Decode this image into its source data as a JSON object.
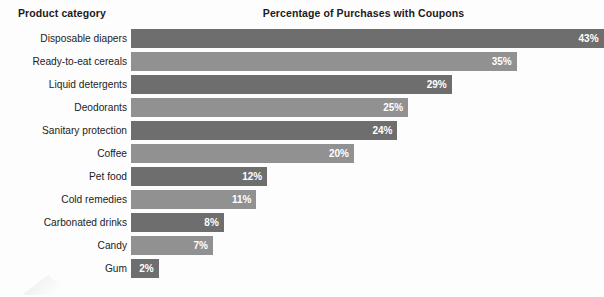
{
  "header": {
    "category_label": "Product category",
    "title": "Percentage of Purchases with Coupons"
  },
  "colors": {
    "background": "#fdfdfd",
    "bar_dark": "#6e6e6e",
    "bar_light": "#919191",
    "text": "#1c1c1c",
    "value_text": "#ffffff"
  },
  "chart_data": {
    "type": "bar",
    "orientation": "horizontal",
    "title": "Percentage of Purchases with Coupons",
    "xlabel": "",
    "ylabel": "Product category",
    "xlim": [
      0,
      43
    ],
    "grid": false,
    "legend": null,
    "value_suffix": "%",
    "categories": [
      "Disposable diapers",
      "Ready-to-eat cereals",
      "Liquid detergents",
      "Deodorants",
      "Sanitary protection",
      "Coffee",
      "Pet food",
      "Cold remedies",
      "Carbonated drinks",
      "Candy",
      "Gum"
    ],
    "values": [
      43,
      35,
      29,
      25,
      24,
      20,
      12,
      11,
      8,
      7,
      2
    ],
    "labels": [
      "43%",
      "35%",
      "29%",
      "25%",
      "24%",
      "20%",
      "12%",
      "11%",
      "8%",
      "7%",
      "2%"
    ],
    "bar_shades": [
      "dark",
      "light",
      "dark",
      "light",
      "dark",
      "light",
      "dark",
      "light",
      "dark",
      "light",
      "dark"
    ]
  }
}
